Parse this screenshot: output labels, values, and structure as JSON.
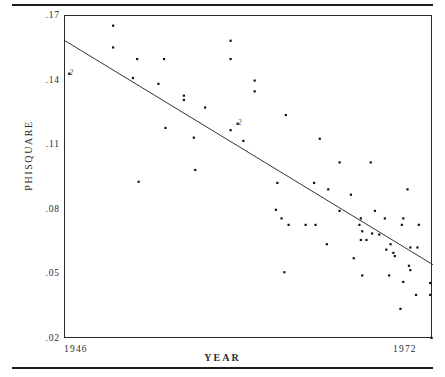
{
  "figure": {
    "y_axis_title": "PHISQUARE",
    "x_axis_title": "YEAR"
  },
  "chart_data": {
    "type": "scatter",
    "title": "",
    "xlabel": "YEAR",
    "ylabel": "PHISQUARE",
    "xlim": [
      1946,
      1972
    ],
    "ylim": [
      0.02,
      0.17
    ],
    "grid": false,
    "legend": null,
    "xticks": [
      "1946",
      "1972"
    ],
    "xtick_values": [
      1946,
      1972
    ],
    "yticks": [
      ".17",
      ".14",
      ".11",
      ".08",
      ".05",
      ".02"
    ],
    "ytick_values": [
      0.17,
      0.14,
      0.11,
      0.08,
      0.05,
      0.02
    ],
    "regression_line": {
      "x_start": 1946,
      "y_start": 0.1585,
      "x_end": 1972,
      "y_end": 0.0545,
      "slope": -0.004,
      "note": "fitted least-squares trend line"
    },
    "overplot_labels": [
      {
        "text": "2",
        "x": 1946.3,
        "y": 0.1432,
        "note": "two coincident points"
      },
      {
        "text": "2",
        "x": 1958.2,
        "y": 0.12,
        "note": "two coincident points"
      }
    ],
    "points": [
      {
        "x": 1949.4,
        "y": 0.1655
      },
      {
        "x": 1946.3,
        "y": 0.1432
      },
      {
        "x": 1949.4,
        "y": 0.1554
      },
      {
        "x": 1951.1,
        "y": 0.15
      },
      {
        "x": 1953.0,
        "y": 0.15
      },
      {
        "x": 1957.7,
        "y": 0.1585
      },
      {
        "x": 1957.7,
        "y": 0.15
      },
      {
        "x": 1950.8,
        "y": 0.1412
      },
      {
        "x": 1952.6,
        "y": 0.1385
      },
      {
        "x": 1959.4,
        "y": 0.14
      },
      {
        "x": 1954.4,
        "y": 0.133
      },
      {
        "x": 1954.4,
        "y": 0.131
      },
      {
        "x": 1959.4,
        "y": 0.135
      },
      {
        "x": 1955.9,
        "y": 0.1275
      },
      {
        "x": 1961.6,
        "y": 0.124
      },
      {
        "x": 1958.2,
        "y": 0.12
      },
      {
        "x": 1953.1,
        "y": 0.118
      },
      {
        "x": 1957.7,
        "y": 0.117
      },
      {
        "x": 1955.1,
        "y": 0.1135
      },
      {
        "x": 1958.6,
        "y": 0.112
      },
      {
        "x": 1964.0,
        "y": 0.113
      },
      {
        "x": 1955.2,
        "y": 0.0985
      },
      {
        "x": 1965.4,
        "y": 0.102
      },
      {
        "x": 1967.6,
        "y": 0.102
      },
      {
        "x": 1951.2,
        "y": 0.093
      },
      {
        "x": 1961.0,
        "y": 0.0925
      },
      {
        "x": 1963.6,
        "y": 0.0925
      },
      {
        "x": 1964.6,
        "y": 0.0895
      },
      {
        "x": 1970.2,
        "y": 0.0895
      },
      {
        "x": 1966.2,
        "y": 0.087
      },
      {
        "x": 1960.9,
        "y": 0.08
      },
      {
        "x": 1965.4,
        "y": 0.0795
      },
      {
        "x": 1967.9,
        "y": 0.0795
      },
      {
        "x": 1961.3,
        "y": 0.076
      },
      {
        "x": 1966.9,
        "y": 0.076
      },
      {
        "x": 1968.6,
        "y": 0.076
      },
      {
        "x": 1969.9,
        "y": 0.076
      },
      {
        "x": 1961.8,
        "y": 0.073
      },
      {
        "x": 1963.0,
        "y": 0.073
      },
      {
        "x": 1963.7,
        "y": 0.073
      },
      {
        "x": 1966.8,
        "y": 0.073
      },
      {
        "x": 1969.8,
        "y": 0.073
      },
      {
        "x": 1971.0,
        "y": 0.073
      },
      {
        "x": 1967.0,
        "y": 0.07
      },
      {
        "x": 1967.7,
        "y": 0.069
      },
      {
        "x": 1968.2,
        "y": 0.0685
      },
      {
        "x": 1966.9,
        "y": 0.066
      },
      {
        "x": 1967.3,
        "y": 0.066
      },
      {
        "x": 1964.5,
        "y": 0.064
      },
      {
        "x": 1969.0,
        "y": 0.064
      },
      {
        "x": 1970.4,
        "y": 0.0625
      },
      {
        "x": 1970.9,
        "y": 0.0625
      },
      {
        "x": 1968.7,
        "y": 0.0615
      },
      {
        "x": 1969.2,
        "y": 0.06
      },
      {
        "x": 1969.3,
        "y": 0.0585
      },
      {
        "x": 1966.4,
        "y": 0.0575
      },
      {
        "x": 1970.3,
        "y": 0.054
      },
      {
        "x": 1970.4,
        "y": 0.052
      },
      {
        "x": 1961.5,
        "y": 0.051
      },
      {
        "x": 1967.0,
        "y": 0.0495
      },
      {
        "x": 1968.9,
        "y": 0.0495
      },
      {
        "x": 1969.9,
        "y": 0.0465
      },
      {
        "x": 1971.8,
        "y": 0.046
      },
      {
        "x": 1970.8,
        "y": 0.0405
      },
      {
        "x": 1971.8,
        "y": 0.0405
      },
      {
        "x": 1969.7,
        "y": 0.034
      },
      {
        "x": 1971.9,
        "y": 0.0205
      }
    ]
  }
}
